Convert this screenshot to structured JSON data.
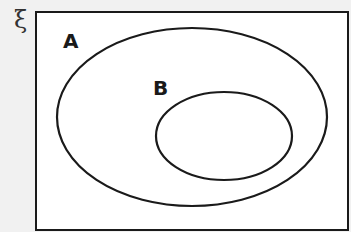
{
  "diagram": {
    "type": "venn",
    "universal_set_symbol": "ξ",
    "sets": [
      {
        "name": "A",
        "label": "A",
        "contains": [
          "B"
        ]
      },
      {
        "name": "B",
        "label": "B",
        "subset_of": "A"
      }
    ],
    "colors": {
      "outline": "#1a1a1a",
      "fill": "#ffffff",
      "background": "#f1f1f1"
    }
  }
}
